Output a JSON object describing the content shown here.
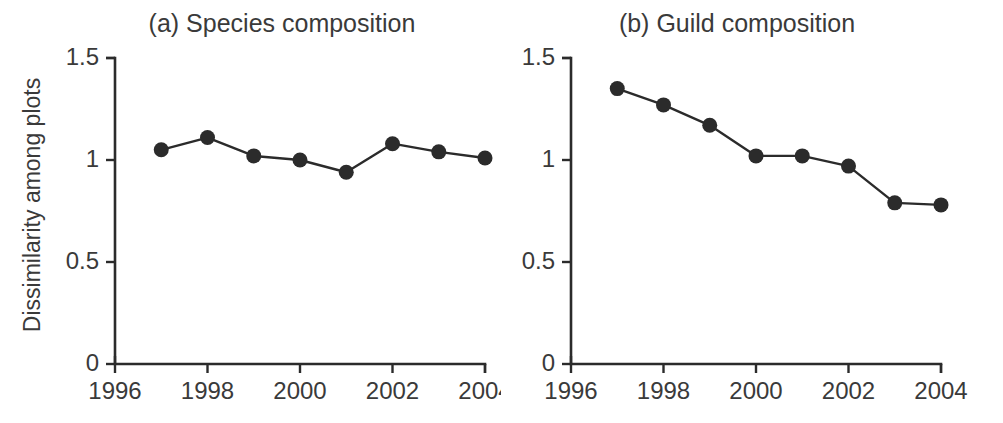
{
  "figure": {
    "ylabel": "Dissimilarity among plots"
  },
  "chart_data": [
    {
      "type": "line",
      "title": "(a) Species composition",
      "xlabel": "",
      "ylabel": "Dissimilarity among plots",
      "x": [
        1997,
        1998,
        1999,
        2000,
        2001,
        2002,
        2003,
        2004
      ],
      "values": [
        1.05,
        1.11,
        1.02,
        1.0,
        0.94,
        1.08,
        1.04,
        1.01
      ],
      "xlim": [
        1996,
        2004
      ],
      "ylim": [
        0,
        1.5
      ],
      "xticks": [
        1996,
        1998,
        2000,
        2002,
        2004
      ],
      "xticklabels": [
        "1996",
        "1998",
        "2000",
        "2002",
        "2004"
      ],
      "yticks": [
        0,
        0.5,
        1,
        1.5
      ],
      "yticklabels": [
        "0",
        "0.5",
        "1",
        "1.5"
      ],
      "grid": false,
      "legend": false,
      "marker": "filled-circle",
      "color": "#2b2b2b"
    },
    {
      "type": "line",
      "title": "(b) Guild composition",
      "xlabel": "",
      "ylabel": "",
      "x": [
        1997,
        1998,
        1999,
        2000,
        2001,
        2002,
        2003,
        2004
      ],
      "values": [
        1.35,
        1.27,
        1.17,
        1.02,
        1.02,
        0.97,
        0.79,
        0.78
      ],
      "xlim": [
        1996,
        2004
      ],
      "ylim": [
        0,
        1.5
      ],
      "xticks": [
        1996,
        1998,
        2000,
        2002,
        2004
      ],
      "xticklabels": [
        "1996",
        "1998",
        "2000",
        "2002",
        "2004"
      ],
      "yticks": [
        0,
        0.5,
        1,
        1.5
      ],
      "yticklabels": [
        "0",
        "0.5",
        "1",
        "1.5"
      ],
      "grid": false,
      "legend": false,
      "marker": "filled-circle",
      "color": "#2b2b2b"
    }
  ]
}
